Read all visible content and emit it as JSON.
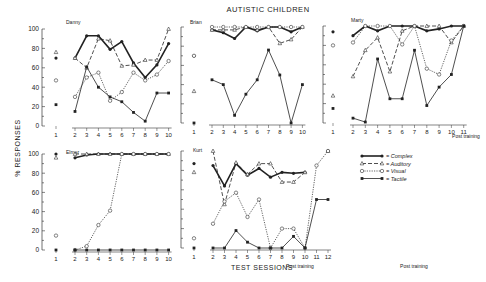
{
  "title": "AUTISTIC CHILDREN",
  "ylabel": "% RESPONSES",
  "xlabel": "TEST SESSIONS",
  "post_training_label": "Post training",
  "legend": [
    {
      "key": "complex",
      "label": "= Complex",
      "marker": "filled-circle",
      "style": "solid-thick"
    },
    {
      "key": "auditory",
      "label": "= Auditory",
      "marker": "triangle",
      "style": "dashed"
    },
    {
      "key": "visual",
      "label": "= Visual",
      "marker": "open-circle",
      "style": "dotted"
    },
    {
      "key": "tactile",
      "label": "= Tactile",
      "marker": "filled-square",
      "style": "solid"
    }
  ],
  "chart_data": [
    {
      "type": "line",
      "subject": "Danny",
      "x": [
        2,
        3,
        4,
        5,
        6,
        7,
        8,
        9,
        10
      ],
      "ylim": [
        0,
        100
      ],
      "pretest": {
        "complex": 70,
        "auditory": 73,
        "visual": 47,
        "tactile": 22
      },
      "series": [
        {
          "name": "Complex",
          "values": [
            70,
            93,
            93,
            79,
            87,
            65,
            50,
            63,
            85
          ]
        },
        {
          "name": "Auditory",
          "values": [
            70,
            60,
            90,
            88,
            62,
            63,
            68,
            68,
            100
          ]
        },
        {
          "name": "Visual",
          "values": [
            30,
            50,
            55,
            26,
            35,
            55,
            47,
            53,
            67
          ]
        },
        {
          "name": "Tactile",
          "values": [
            15,
            61,
            40,
            30,
            25,
            14,
            5,
            34,
            34
          ]
        }
      ]
    },
    {
      "type": "line",
      "subject": "Brian",
      "x": [
        2,
        3,
        4,
        5,
        6,
        7,
        8,
        9,
        10
      ],
      "ylim": [
        0,
        100
      ],
      "pretest": {
        "complex": 70,
        "auditory": 30,
        "visual": 70,
        "tactile": 0
      },
      "series": [
        {
          "name": "Complex",
          "values": [
            97,
            94,
            88,
            100,
            96,
            100,
            100,
            95,
            100
          ]
        },
        {
          "name": "Auditory",
          "values": [
            97,
            97,
            97,
            100,
            97,
            100,
            83,
            87,
            100
          ]
        },
        {
          "name": "Visual",
          "values": [
            100,
            100,
            100,
            100,
            100,
            100,
            100,
            100,
            100
          ]
        },
        {
          "name": "Tactile",
          "values": [
            45,
            40,
            8,
            30,
            45,
            76,
            50,
            0,
            40
          ]
        }
      ],
      "extra_series": [
        {
          "name": "Auditory (lower)",
          "values": [
            54,
            50,
            33,
            55,
            71,
            100,
            100,
            100,
            100
          ]
        }
      ]
    },
    {
      "type": "line",
      "subject": "Marty",
      "x": [
        2,
        3,
        4,
        5,
        6,
        7,
        8,
        9,
        10,
        11
      ],
      "ylim": [
        0,
        100
      ],
      "pretest": {
        "complex": 94,
        "auditory": 25,
        "visual": 80,
        "tactile": 15
      },
      "series": [
        {
          "name": "Complex",
          "values": [
            90,
            100,
            95,
            100,
            100,
            100,
            95,
            97,
            100,
            100
          ]
        },
        {
          "name": "Auditory",
          "values": [
            48,
            75,
            88,
            53,
            95,
            100,
            100,
            100,
            83,
            100
          ]
        },
        {
          "name": "Visual",
          "values": [
            83,
            100,
            100,
            100,
            81,
            100,
            56,
            50,
            85,
            100
          ]
        },
        {
          "name": "Tactile",
          "values": [
            5,
            1,
            66,
            25,
            25,
            75,
            18,
            37,
            50,
            100
          ]
        }
      ]
    },
    {
      "type": "line",
      "subject": "Elmer",
      "x": [
        2,
        3,
        4,
        5,
        6,
        7,
        8,
        9,
        10
      ],
      "ylim": [
        0,
        100
      ],
      "pretest": {
        "complex": 100,
        "auditory": 93,
        "visual": 15,
        "tactile": 0
      },
      "series": [
        {
          "name": "Complex",
          "values": [
            96,
            99,
            100,
            100,
            100,
            100,
            100,
            100,
            100
          ]
        },
        {
          "name": "Auditory",
          "values": [
            100,
            100,
            100,
            100,
            100,
            100,
            100,
            100,
            100
          ]
        },
        {
          "name": "Visual",
          "values": [
            0,
            4,
            26,
            41,
            100,
            100,
            100,
            100,
            100
          ]
        },
        {
          "name": "Tactile",
          "values": [
            0,
            0,
            0,
            0,
            0,
            0,
            0,
            0,
            0
          ]
        }
      ]
    },
    {
      "type": "line",
      "subject": "Kurt",
      "x": [
        2,
        3,
        4,
        5,
        6,
        7,
        8,
        9,
        10,
        11,
        12
      ],
      "ylim": [
        0,
        100
      ],
      "pretest": {
        "complex": 87,
        "auditory": 75,
        "visual": 10,
        "tactile": 0
      },
      "series": [
        {
          "name": "Complex",
          "values": [
            85,
            64,
            87,
            75,
            82,
            73,
            78,
            77,
            78,
            null,
            100
          ]
        },
        {
          "name": "Auditory",
          "values": [
            100,
            45,
            88,
            76,
            87,
            87,
            68,
            68,
            78,
            null,
            100
          ]
        },
        {
          "name": "Visual",
          "values": [
            25,
            48,
            57,
            32,
            50,
            0,
            20,
            20,
            0,
            85,
            100
          ]
        },
        {
          "name": "Tactile",
          "values": [
            0,
            0,
            18,
            6,
            0,
            0,
            0,
            12,
            0,
            50,
            50
          ]
        }
      ]
    }
  ]
}
